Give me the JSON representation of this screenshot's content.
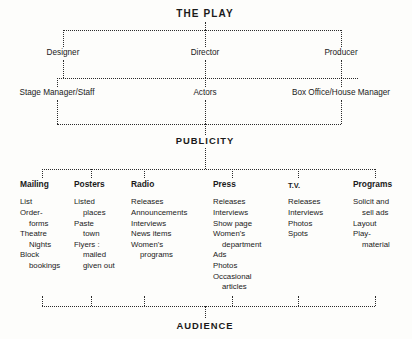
{
  "diagram": {
    "title": "THE PLAY",
    "tier1": [
      {
        "label": "Designer",
        "x": 63
      },
      {
        "label": "Director",
        "x": 205
      },
      {
        "label": "Producer",
        "x": 341
      }
    ],
    "tier2": [
      {
        "label": "Stage Manager/Staff",
        "x": 57
      },
      {
        "label": "Actors",
        "x": 205
      },
      {
        "label": "Box Office/House Manager",
        "x": 341
      }
    ],
    "section": "PUBLICITY",
    "audience": "AUDIENCE",
    "columns": [
      {
        "header": "Mailing",
        "x": 20,
        "tick": 42,
        "items": [
          {
            "text": "List",
            "indent": false
          },
          {
            "text": "Order-",
            "indent": false
          },
          {
            "text": "forms",
            "indent": true
          },
          {
            "text": "Theatre",
            "indent": false
          },
          {
            "text": "Nights",
            "indent": true
          },
          {
            "text": "Block",
            "indent": false
          },
          {
            "text": "bookings",
            "indent": true
          }
        ]
      },
      {
        "header": "Posters",
        "x": 74,
        "tick": 91,
        "items": [
          {
            "text": "Listed",
            "indent": false
          },
          {
            "text": "places",
            "indent": true
          },
          {
            "text": "Paste",
            "indent": false
          },
          {
            "text": "town",
            "indent": true
          },
          {
            "text": "Flyers :",
            "indent": false
          },
          {
            "text": "mailed",
            "indent": true
          },
          {
            "text": "given out",
            "indent": true
          }
        ]
      },
      {
        "header": "Radio",
        "x": 131,
        "tick": 144,
        "items": [
          {
            "text": "Releases",
            "indent": false
          },
          {
            "text": "Announcements",
            "indent": false
          },
          {
            "text": "Interviews",
            "indent": false
          },
          {
            "text": "News items",
            "indent": false
          },
          {
            "text": "Women's",
            "indent": false
          },
          {
            "text": "programs",
            "indent": true
          }
        ]
      },
      {
        "header": "Press",
        "x": 213,
        "tick": 232,
        "items": [
          {
            "text": "Releases",
            "indent": false
          },
          {
            "text": "Interviews",
            "indent": false
          },
          {
            "text": "Show page",
            "indent": false
          },
          {
            "text": "Women's",
            "indent": false
          },
          {
            "text": "department",
            "indent": true
          },
          {
            "text": "Ads",
            "indent": false
          },
          {
            "text": "Photos",
            "indent": false
          },
          {
            "text": "Occasional",
            "indent": false
          },
          {
            "text": "articles",
            "indent": true
          }
        ]
      },
      {
        "header": "T.V.",
        "x": 288,
        "tick": 298,
        "small": true,
        "items": [
          {
            "text": "Releases",
            "indent": false
          },
          {
            "text": "Interviews",
            "indent": false
          },
          {
            "text": "Photos",
            "indent": false
          },
          {
            "text": "Spots",
            "indent": false
          }
        ]
      },
      {
        "header": "Programs",
        "x": 353,
        "tick": 375,
        "items": [
          {
            "text": "Solicit and",
            "indent": false
          },
          {
            "text": "sell ads",
            "indent": true
          },
          {
            "text": "Layout",
            "indent": false
          },
          {
            "text": "Play-",
            "indent": false
          },
          {
            "text": "material",
            "indent": true
          }
        ]
      }
    ]
  }
}
